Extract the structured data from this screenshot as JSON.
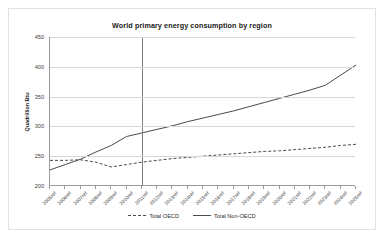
{
  "chart_data": {
    "type": "line",
    "title": "World primary energy consumption by region",
    "xlabel": "",
    "ylabel": "Quadrillion Btu",
    "ylim": [
      200,
      450
    ],
    "yticks": [
      200,
      250,
      300,
      350,
      400,
      450
    ],
    "grid": true,
    "legend_position": "bottom",
    "categories": [
      "2005ref",
      "2006ref",
      "2007ref",
      "2008ref",
      "2009ref",
      "2010ref",
      "2011ref",
      "2012ref",
      "2013ref",
      "2014ref",
      "2015ref",
      "2016ref",
      "2017ref",
      "2018ref",
      "2019ref",
      "2020ref",
      "2021ref",
      "2022ref",
      "2023ref",
      "2024ref",
      "2025ref"
    ],
    "series": [
      {
        "name": "Total OECD",
        "style": "dashed",
        "color": "#4a4a4a",
        "values": [
          243,
          243,
          244,
          240,
          232,
          236,
          240,
          243,
          246,
          248,
          250,
          252,
          254,
          256,
          258,
          259,
          261,
          263,
          265,
          268,
          270
        ]
      },
      {
        "name": "Total Non-OECD",
        "style": "solid",
        "color": "#4a4a4a",
        "values": [
          227,
          236,
          245,
          257,
          268,
          283,
          289,
          295,
          301,
          308,
          314,
          320,
          326,
          333,
          340,
          347,
          354,
          361,
          369,
          386,
          403
        ]
      }
    ],
    "annotations": [
      {
        "name": "history-projection-divider",
        "x_category": "2011ref"
      }
    ]
  }
}
